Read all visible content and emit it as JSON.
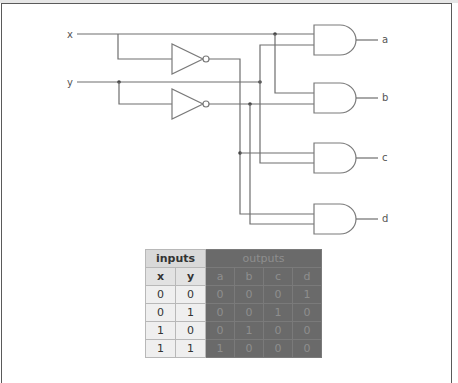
{
  "diagram": {
    "type": "logic-circuit",
    "inputs": [
      {
        "id": "x",
        "label": "x"
      },
      {
        "id": "y",
        "label": "y"
      }
    ],
    "inverters": [
      {
        "id": "not_x",
        "input": "x",
        "output": "x'"
      },
      {
        "id": "not_y",
        "input": "y",
        "output": "y'"
      }
    ],
    "and_gates": [
      {
        "id": "and_a",
        "inputs": [
          "x",
          "y"
        ],
        "output": "a"
      },
      {
        "id": "and_b",
        "inputs": [
          "x",
          "y'"
        ],
        "output": "b"
      },
      {
        "id": "and_c",
        "inputs": [
          "x'",
          "y"
        ],
        "output": "c"
      },
      {
        "id": "and_d",
        "inputs": [
          "x'",
          "y'"
        ],
        "output": "d"
      }
    ],
    "outputs": [
      {
        "id": "a",
        "label": "a"
      },
      {
        "id": "b",
        "label": "b"
      },
      {
        "id": "c",
        "label": "c"
      },
      {
        "id": "d",
        "label": "d"
      }
    ]
  },
  "truth_table": {
    "group_headers": {
      "inputs": "inputs",
      "outputs": "outputs"
    },
    "columns": [
      "x",
      "y",
      "a",
      "b",
      "c",
      "d"
    ],
    "rows": [
      [
        "0",
        "0",
        "0",
        "0",
        "0",
        "1"
      ],
      [
        "0",
        "1",
        "0",
        "0",
        "1",
        "0"
      ],
      [
        "1",
        "0",
        "0",
        "1",
        "0",
        "0"
      ],
      [
        "1",
        "1",
        "1",
        "0",
        "0",
        "0"
      ]
    ]
  },
  "colors": {
    "outputs_background": "#6a6a6a",
    "outputs_text": "#8e8e8e",
    "inputs_header_background": "#d9d9d9",
    "wire": "#6e6e6e"
  }
}
